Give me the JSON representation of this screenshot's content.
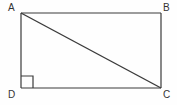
{
  "figure": {
    "type": "geometry-diagram",
    "shape": "rectangle-with-diagonal",
    "background_color": "#fefefe",
    "stroke_color": "#3a3a3a",
    "label_color": "#333333",
    "vertices": {
      "A": {
        "label": "A",
        "x": 21,
        "y": 13,
        "position": "top-left"
      },
      "B": {
        "label": "B",
        "x": 161,
        "y": 13,
        "position": "top-right"
      },
      "C": {
        "label": "C",
        "x": 161,
        "y": 88,
        "position": "bottom-right"
      },
      "D": {
        "label": "D",
        "x": 21,
        "y": 88,
        "position": "bottom-left"
      }
    },
    "edges": [
      {
        "name": "AB",
        "from": "A",
        "to": "B"
      },
      {
        "name": "BC",
        "from": "B",
        "to": "C"
      },
      {
        "name": "CD",
        "from": "C",
        "to": "D"
      },
      {
        "name": "DA",
        "from": "D",
        "to": "A"
      }
    ],
    "diagonal": {
      "name": "AC",
      "from": "A",
      "to": "C"
    },
    "right_angle_marker": {
      "at_vertex": "D",
      "size": 12,
      "name": "right-angle-square"
    }
  }
}
